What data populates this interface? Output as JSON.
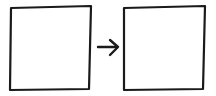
{
  "diagram": {
    "type": "box-arrow-box",
    "nodes": [
      {
        "id": "left-box",
        "label": ""
      },
      {
        "id": "right-box",
        "label": ""
      }
    ],
    "edges": [
      {
        "from": "left-box",
        "to": "right-box",
        "style": "arrow"
      }
    ],
    "colors": {
      "stroke": "#1a1a1a",
      "fill": "#ffffff",
      "background": "#ffffff"
    }
  }
}
